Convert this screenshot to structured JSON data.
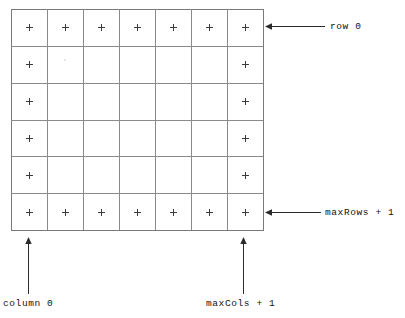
{
  "diagram": {
    "type": "annotated-grid",
    "colors": {
      "background": "#ffffff",
      "grid_line": "#8a8a8a",
      "grid_border": "#7a7a7a",
      "plus_mark": "#3a3a3a",
      "arrow": "#2b2b2b",
      "label_text": "#111111"
    },
    "grid": {
      "x": 11,
      "y": 9,
      "width": 252,
      "height": 221,
      "columns": 7,
      "rows": 6,
      "cell_width": 36,
      "cell_height": 36.83,
      "marks": {
        "glyph": "+",
        "size": 7,
        "pattern": [
          [
            1,
            1,
            1,
            1,
            1,
            1,
            1
          ],
          [
            1,
            0,
            0,
            0,
            0,
            0,
            1
          ],
          [
            1,
            0,
            0,
            0,
            0,
            0,
            1
          ],
          [
            1,
            0,
            0,
            0,
            0,
            0,
            1
          ],
          [
            1,
            0,
            0,
            0,
            0,
            0,
            1
          ],
          [
            1,
            1,
            1,
            1,
            1,
            1,
            1
          ]
        ]
      }
    },
    "annotations": [
      {
        "id": "row-0",
        "text": "row 0",
        "direction": "left",
        "orientation": "horizontal",
        "tip": {
          "x": 265,
          "y": 26
        },
        "tail": {
          "x": 325,
          "y": 26
        }
      },
      {
        "id": "max-rows",
        "text": "maxRows + 1",
        "direction": "left",
        "orientation": "horizontal",
        "tip": {
          "x": 265,
          "y": 212
        },
        "tail": {
          "x": 321,
          "y": 212
        }
      },
      {
        "id": "column-0",
        "text": "column 0",
        "direction": "up",
        "orientation": "vertical",
        "tip": {
          "x": 28,
          "y": 237
        },
        "tail": {
          "x": 28,
          "y": 294
        }
      },
      {
        "id": "max-cols",
        "text": "maxCols + 1",
        "direction": "up",
        "orientation": "vertical",
        "tip": {
          "x": 243,
          "y": 237
        },
        "tail": {
          "x": 243,
          "y": 294
        }
      }
    ]
  },
  "labels": {
    "row0": "row 0",
    "maxrows": "maxRows + 1",
    "column0": "column 0",
    "maxcols": "maxCols + 1"
  }
}
